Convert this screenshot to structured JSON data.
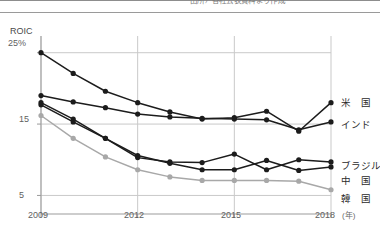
{
  "header": {
    "cropped_text": "出所）各社公表資料より作成"
  },
  "axes": {
    "y_axis_title": "ROIC",
    "y_ticks": [
      "25%",
      "15",
      "5"
    ],
    "y_tick_values": [
      25,
      15,
      5
    ],
    "x_ticks": [
      "2009",
      "2012",
      "2015",
      "2018"
    ],
    "x_unit": "(年)"
  },
  "legend": {
    "position": "right-of-plot",
    "items": [
      {
        "key": "usa",
        "label": "米　国",
        "color": "#1c1c1c"
      },
      {
        "key": "india",
        "label": "インド",
        "color": "#1c1c1c"
      },
      {
        "key": "brazil",
        "label": "ブラジル",
        "color": "#1c1c1c"
      },
      {
        "key": "china",
        "label": "中　国",
        "color": "#1c1c1c"
      },
      {
        "key": "korea",
        "label": "韓　国",
        "color": "#a8a8a8"
      }
    ]
  },
  "chart_data": {
    "type": "line",
    "title": "",
    "xlabel": "(年)",
    "ylabel": "ROIC",
    "x": [
      2009,
      2010,
      2011,
      2012,
      2013,
      2014,
      2015,
      2016,
      2017,
      2018
    ],
    "xlim": [
      2009,
      2018
    ],
    "ylim": [
      2.4,
      26.5
    ],
    "y_unit": "%",
    "grid": true,
    "gridlines_y": [
      25,
      15,
      5
    ],
    "gridlines_x": [
      2009,
      2012,
      2015,
      2018
    ],
    "legend_position": "right",
    "series": [
      {
        "name": "米　国",
        "key": "usa",
        "color": "#1c1c1c",
        "marker": "circle",
        "values": [
          25.0,
          22.1,
          19.6,
          18.0,
          16.7,
          15.7,
          15.9,
          16.8,
          14.0,
          18.0
        ]
      },
      {
        "name": "インド",
        "key": "india",
        "color": "#1c1c1c",
        "marker": "circle",
        "values": [
          19.0,
          18.1,
          17.3,
          16.4,
          16.0,
          15.8,
          15.7,
          15.6,
          14.2,
          15.3
        ]
      },
      {
        "name": "ブラジル",
        "key": "brazil",
        "color": "#1c1c1c",
        "marker": "circle",
        "values": [
          18.0,
          15.7,
          13.0,
          10.3,
          9.7,
          9.6,
          10.8,
          8.6,
          10.0,
          9.7
        ]
      },
      {
        "name": "中　国",
        "key": "china",
        "color": "#1c1c1c",
        "marker": "circle",
        "values": [
          17.7,
          15.3,
          13.0,
          10.6,
          9.5,
          8.6,
          8.6,
          9.9,
          8.5,
          9.0
        ]
      },
      {
        "name": "韓　国",
        "key": "korea",
        "color": "#a8a8a8",
        "marker": "circle",
        "values": [
          16.2,
          13.0,
          10.4,
          8.6,
          7.6,
          7.1,
          7.1,
          7.1,
          7.0,
          5.8
        ]
      }
    ]
  }
}
